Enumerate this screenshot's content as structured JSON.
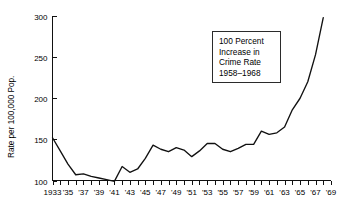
{
  "chart_data": {
    "type": "line",
    "title": "",
    "xlabel": "",
    "ylabel": "Rate per 100,000 Pop.",
    "xlim": [
      1933,
      1969
    ],
    "ylim": [
      100,
      300
    ],
    "grid": false,
    "legend": null,
    "y_ticks": [
      100,
      150,
      200,
      250,
      300
    ],
    "y_tick_labels": [
      "100",
      "150",
      "200",
      "250",
      "300"
    ],
    "x_ticks": [
      1933,
      1934,
      1935,
      1936,
      1937,
      1938,
      1939,
      1940,
      1941,
      1942,
      1943,
      1944,
      1945,
      1946,
      1947,
      1948,
      1949,
      1950,
      1951,
      1952,
      1953,
      1954,
      1955,
      1956,
      1957,
      1958,
      1959,
      1960,
      1961,
      1962,
      1963,
      1964,
      1965,
      1966,
      1967,
      1968,
      1969
    ],
    "x_tick_labels": [
      "1933",
      "'35",
      "'37",
      "'39",
      "'41",
      "'43",
      "'45",
      "'47",
      "'49",
      "'51",
      "'53",
      "'55",
      "'57",
      "'59",
      "'61",
      "'63",
      "'65",
      "'67",
      "'69"
    ],
    "x_tick_label_years": [
      1933,
      1935,
      1937,
      1939,
      1941,
      1943,
      1945,
      1947,
      1949,
      1951,
      1953,
      1955,
      1957,
      1959,
      1961,
      1963,
      1965,
      1967,
      1969
    ],
    "x": [
      1933,
      1934,
      1935,
      1936,
      1937,
      1938,
      1939,
      1940,
      1941,
      1942,
      1943,
      1944,
      1945,
      1946,
      1947,
      1948,
      1949,
      1950,
      1951,
      1952,
      1953,
      1954,
      1955,
      1956,
      1957,
      1958,
      1959,
      1960,
      1961,
      1962,
      1963,
      1964,
      1965,
      1966,
      1967,
      1968
    ],
    "values": [
      152,
      136,
      120,
      107,
      108,
      105,
      103,
      101,
      99,
      117,
      110,
      114,
      127,
      143,
      138,
      135,
      140,
      137,
      129,
      136,
      145,
      145,
      138,
      135,
      139,
      144,
      144,
      160,
      156,
      158,
      165,
      186,
      200,
      220,
      253,
      298
    ],
    "annotations": [
      {
        "name": "crime-rate-callout",
        "lines": [
          "100 Percent",
          "Increase in",
          "Crime Rate",
          "1958–1968"
        ]
      }
    ],
    "colors": {
      "line": "#111111",
      "axis": "#111111",
      "background": "#ffffff",
      "annotation_border": "#2b2b2b"
    }
  }
}
